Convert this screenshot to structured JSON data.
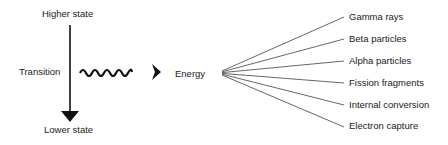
{
  "diagram": {
    "higher_state": "Higher state",
    "lower_state": "Lower state",
    "transition": "Transition",
    "energy": "Energy",
    "outcomes": [
      "Gamma rays",
      "Beta particles",
      "Alpha particles",
      "Fission fragments",
      "Internal conversion",
      "Electron capture"
    ],
    "colors": {
      "ink": "#111111",
      "fan_line": "#555555"
    }
  }
}
